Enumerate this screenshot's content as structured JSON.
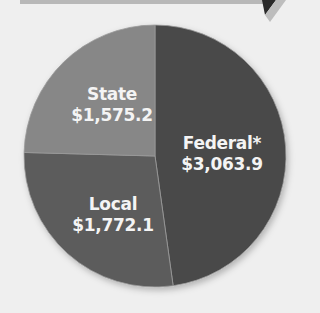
{
  "chart_data": {
    "type": "pie",
    "title": "",
    "categories": [
      "Federal*",
      "Local",
      "State"
    ],
    "values": [
      3063.9,
      1772.1,
      1575.2
    ],
    "value_labels": [
      "$3,063.9",
      "$1,772.1",
      "$1,575.2"
    ],
    "colors": [
      "#4a4a4a",
      "#5c5c5c",
      "#878787"
    ],
    "legend": "none (direct labels)"
  },
  "labels": {
    "federal": {
      "name": "Federal*",
      "value": "$3,063.9"
    },
    "local": {
      "name": "Local",
      "value": "$1,772.1"
    },
    "state": {
      "name": "State",
      "value": "$1,575.2"
    }
  }
}
